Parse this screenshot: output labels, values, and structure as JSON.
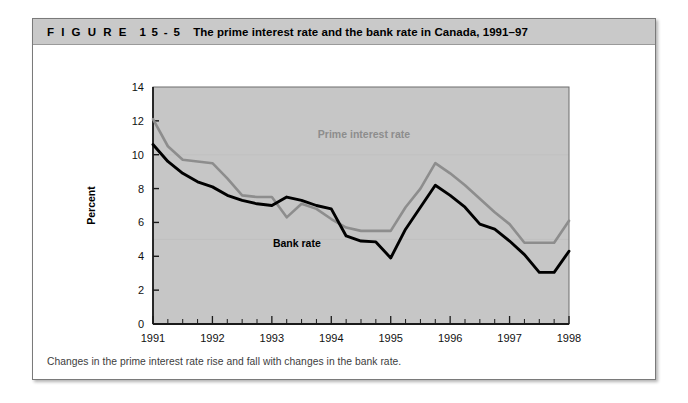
{
  "figure": {
    "label": "F I G U R E",
    "number": "1 5 - 5",
    "title": "The prime interest rate and the bank rate in Canada, 1991–97",
    "caption": "Changes in the prime interest rate rise and fall with changes in the bank rate."
  },
  "colors": {
    "header_band": "#c9c9c9",
    "plot_background": "#c6c6c6",
    "prime_series": "#8d8d8d",
    "bank_series": "#000000",
    "frame_border": "#7a7a7a",
    "axis": "#1a1a1a"
  },
  "chart_data": {
    "type": "line",
    "title": "The prime interest rate and the bank rate in Canada, 1991–97",
    "xlabel": "Year",
    "ylabel": "Percent",
    "xlim": [
      1991,
      1998
    ],
    "ylim": [
      0,
      14
    ],
    "ytick_step": 2,
    "yticks": [
      0,
      2,
      4,
      6,
      8,
      10,
      12,
      14
    ],
    "xticks": [
      1991,
      1992,
      1993,
      1994,
      1995,
      1996,
      1997,
      1998
    ],
    "xtick_labels": [
      "1991",
      "1992",
      "1993",
      "1994",
      "1995",
      "1996",
      "1997",
      "1998"
    ],
    "minor_ticks_per_year": 3,
    "grid": false,
    "legend": "inline-labels",
    "x": [
      1991.0,
      1991.25,
      1991.5,
      1991.75,
      1992.0,
      1992.25,
      1992.5,
      1992.75,
      1993.0,
      1993.25,
      1993.5,
      1993.75,
      1994.0,
      1994.25,
      1994.5,
      1994.75,
      1995.0,
      1995.25,
      1995.5,
      1995.75,
      1996.0,
      1996.25,
      1996.5,
      1996.75,
      1997.0,
      1997.25,
      1997.5,
      1997.75,
      1998.0
    ],
    "series": [
      {
        "name": "Prime interest rate",
        "color": "#8d8d8d",
        "label_x": 1994.55,
        "label_y": 11.0,
        "values": [
          12.1,
          10.5,
          9.7,
          9.6,
          9.5,
          8.6,
          7.6,
          7.5,
          7.5,
          6.3,
          7.1,
          6.8,
          6.2,
          5.7,
          5.5,
          5.5,
          5.5,
          6.9,
          8.0,
          9.5,
          8.9,
          8.2,
          7.4,
          6.6,
          5.9,
          4.8,
          4.8,
          4.8,
          6.1
        ]
      },
      {
        "name": "Bank rate",
        "color": "#000000",
        "label_x": 1993.42,
        "label_y": 4.55,
        "values": [
          10.6,
          9.6,
          8.9,
          8.4,
          8.1,
          7.6,
          7.3,
          7.1,
          7.0,
          7.5,
          7.3,
          7.0,
          6.8,
          5.2,
          4.9,
          4.85,
          3.9,
          5.6,
          6.9,
          8.2,
          7.6,
          6.9,
          5.9,
          5.6,
          4.9,
          4.1,
          3.05,
          3.05,
          4.3
        ]
      }
    ]
  }
}
